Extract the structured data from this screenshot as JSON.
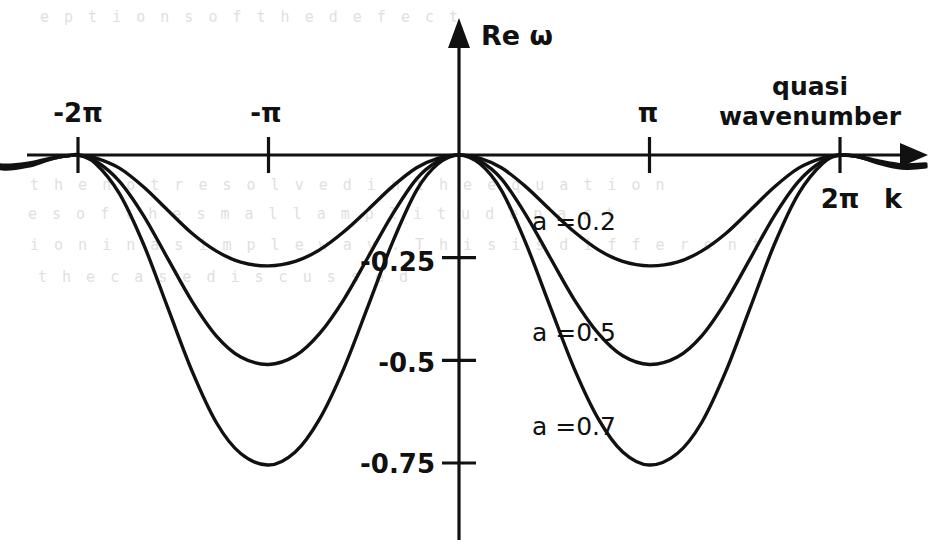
{
  "figure": {
    "background_color": "#ffffff",
    "ink_color": "#111111",
    "x_axis": {
      "label": "k",
      "caption_line1": "quasi",
      "caption_line2": "wavenumber",
      "tick_labels": [
        "-2π",
        "-π",
        "π",
        "2π"
      ],
      "tick_values": [
        -6.2832,
        -3.1416,
        3.1416,
        6.2832
      ],
      "range": [
        -7.9,
        7.7
      ]
    },
    "y_axis": {
      "label": "Re ω",
      "tick_labels": [
        "-0.25",
        "-0.5",
        "-0.75"
      ],
      "tick_values": [
        -0.25,
        -0.5,
        -0.75
      ],
      "range": [
        -0.96,
        0.32
      ]
    },
    "curve_labels": [
      "a =0.2",
      "a =0.5",
      "a =0.7"
    ],
    "ghost_text": [
      "e p t i o n s   o f   t h e   d e f e c t",
      "t h e   n o t   r e s o l v e d   i n   t h e   e q u a t i o n",
      "e s   o f   t h e   s m a l l   a m p l i t u d e   p a r t",
      "i o n   i n   a   s i m p l e   w a y .   T h i s   i s   d i f f e r e n t",
      "t h e   c a s e   d i s c u s s e d"
    ]
  },
  "chart_data": {
    "type": "line",
    "title": "",
    "xlabel": "k  (quasi wavenumber)",
    "ylabel": "Re ω",
    "xlim": [
      -7.9,
      7.7
    ],
    "ylim": [
      -0.96,
      0.32
    ],
    "xticks": [
      -6.2832,
      -3.1416,
      3.1416,
      6.2832
    ],
    "xticklabels": [
      "-2π",
      "-π",
      "π",
      "2π"
    ],
    "yticks": [
      -0.25,
      -0.5,
      -0.75
    ],
    "yticklabels": [
      "-0.25",
      "-0.5",
      "-0.75"
    ],
    "grid": false,
    "legend": "inline-curve-labels",
    "series": [
      {
        "name": "a =0.2",
        "label_position": {
          "x": 3.1,
          "y": -0.16
        },
        "minimum": {
          "x": 3.1416,
          "y": -0.27
        },
        "x": [
          -7.9,
          -7.5,
          -7.1,
          -6.8,
          -6.6,
          -6.4,
          -6.2832,
          -6.0,
          -5.6,
          -5.2,
          -4.8,
          -4.4,
          -4.0,
          -3.6,
          -3.1416,
          -2.7,
          -2.3,
          -1.9,
          -1.5,
          -1.1,
          -0.7,
          -0.35,
          0.0,
          0.35,
          0.7,
          1.1,
          1.5,
          1.9,
          2.3,
          2.7,
          3.1416,
          3.6,
          4.0,
          4.4,
          4.8,
          5.2,
          5.6,
          6.0,
          6.2832,
          6.6,
          6.9,
          7.3,
          7.7
        ],
        "y": [
          -0.015,
          -0.025,
          -0.02,
          -0.01,
          -0.004,
          -0.001,
          0.0,
          -0.007,
          -0.032,
          -0.078,
          -0.135,
          -0.191,
          -0.234,
          -0.261,
          -0.27,
          -0.259,
          -0.231,
          -0.187,
          -0.133,
          -0.077,
          -0.031,
          -0.008,
          0.0,
          -0.008,
          -0.031,
          -0.077,
          -0.133,
          -0.187,
          -0.231,
          -0.259,
          -0.27,
          -0.261,
          -0.234,
          -0.191,
          -0.135,
          -0.078,
          -0.032,
          -0.007,
          0.0,
          -0.004,
          -0.014,
          -0.024,
          -0.022
        ]
      },
      {
        "name": "a =0.5",
        "label_position": {
          "x": 3.1,
          "y": -0.43
        },
        "minimum": {
          "x": 3.1416,
          "y": -0.51
        },
        "x": [
          -7.9,
          -7.5,
          -7.1,
          -6.8,
          -6.6,
          -6.4,
          -6.2832,
          -6.0,
          -5.6,
          -5.2,
          -4.8,
          -4.4,
          -4.0,
          -3.6,
          -3.1416,
          -2.7,
          -2.3,
          -1.9,
          -1.5,
          -1.1,
          -0.7,
          -0.35,
          0.0,
          0.35,
          0.7,
          1.1,
          1.5,
          1.9,
          2.3,
          2.7,
          3.1416,
          3.6,
          4.0,
          4.4,
          4.8,
          5.2,
          5.6,
          6.0,
          6.2832,
          6.6,
          6.9,
          7.3,
          7.7
        ],
        "y": [
          -0.018,
          -0.03,
          -0.024,
          -0.012,
          -0.005,
          -0.001,
          0.0,
          -0.014,
          -0.064,
          -0.148,
          -0.253,
          -0.357,
          -0.441,
          -0.492,
          -0.51,
          -0.489,
          -0.435,
          -0.352,
          -0.249,
          -0.145,
          -0.058,
          -0.015,
          0.0,
          -0.015,
          -0.058,
          -0.145,
          -0.249,
          -0.352,
          -0.435,
          -0.489,
          -0.51,
          -0.492,
          -0.441,
          -0.357,
          -0.253,
          -0.148,
          -0.064,
          -0.014,
          0.0,
          -0.005,
          -0.017,
          -0.029,
          -0.026
        ]
      },
      {
        "name": "a =0.7",
        "label_position": {
          "x": 3.1,
          "y": -0.66
        },
        "minimum": {
          "x": 3.1416,
          "y": -0.755
        },
        "x": [
          -7.9,
          -7.5,
          -7.1,
          -6.8,
          -6.6,
          -6.4,
          -6.2832,
          -6.0,
          -5.6,
          -5.2,
          -4.8,
          -4.4,
          -4.0,
          -3.6,
          -3.1416,
          -2.7,
          -2.3,
          -1.9,
          -1.5,
          -1.1,
          -0.7,
          -0.35,
          0.0,
          0.35,
          0.7,
          1.1,
          1.5,
          1.9,
          2.3,
          2.7,
          3.1416,
          3.6,
          4.0,
          4.4,
          4.8,
          5.2,
          5.6,
          6.0,
          6.2832,
          6.6,
          6.9,
          7.3,
          7.7
        ],
        "y": [
          -0.02,
          -0.034,
          -0.027,
          -0.013,
          -0.005,
          -0.001,
          0.0,
          -0.02,
          -0.094,
          -0.218,
          -0.373,
          -0.527,
          -0.652,
          -0.727,
          -0.755,
          -0.723,
          -0.643,
          -0.52,
          -0.368,
          -0.214,
          -0.086,
          -0.022,
          0.0,
          -0.022,
          -0.086,
          -0.214,
          -0.368,
          -0.52,
          -0.643,
          -0.723,
          -0.755,
          -0.727,
          -0.652,
          -0.527,
          -0.373,
          -0.218,
          -0.094,
          -0.02,
          0.0,
          -0.005,
          -0.019,
          -0.032,
          -0.029
        ]
      }
    ]
  }
}
